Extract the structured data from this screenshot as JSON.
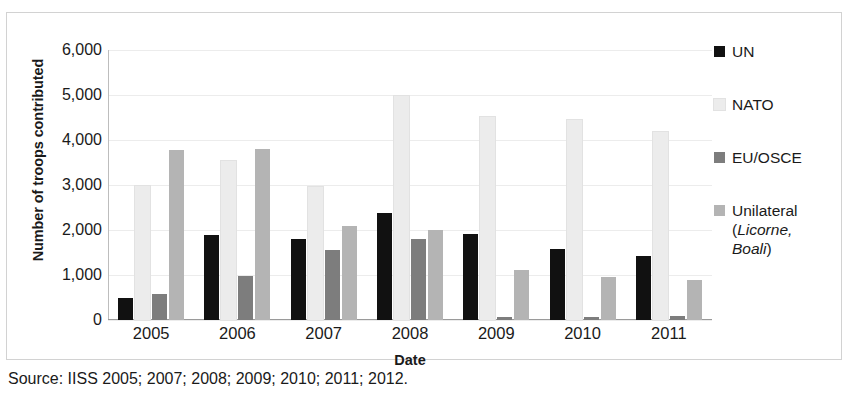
{
  "chart_data": {
    "type": "bar",
    "title": "",
    "xlabel": "Date",
    "ylabel": "Number of troops contributed",
    "categories": [
      "2005",
      "2006",
      "2007",
      "2008",
      "2009",
      "2010",
      "2011"
    ],
    "ylim": [
      0,
      6000
    ],
    "ytick_values": [
      0,
      1000,
      2000,
      3000,
      4000,
      5000,
      6000
    ],
    "ytick_labels": [
      "0",
      "1,000",
      "2,000",
      "3,000",
      "4,000",
      "5,000",
      "6,000"
    ],
    "grid": true,
    "legend_position": "right",
    "series": [
      {
        "name": "UN",
        "color": "#111111",
        "values": [
          490,
          1880,
          1790,
          2370,
          1910,
          1570,
          1430
        ]
      },
      {
        "name": "NATO",
        "color": "#ececec",
        "values": [
          2970,
          3540,
          2960,
          4970,
          4520,
          4440,
          4180
        ]
      },
      {
        "name": "EU/OSCE",
        "color": "#7d7d7d",
        "values": [
          580,
          970,
          1550,
          1810,
          60,
          60,
          80
        ]
      },
      {
        "name": "Unilateral (Licorne, Boali)",
        "color": "#b4b4b4",
        "values": [
          3780,
          3790,
          2080,
          2010,
          1120,
          960,
          890
        ]
      }
    ]
  },
  "legend": {
    "items": [
      {
        "label": "UN",
        "label_italic": "",
        "label_tail": "",
        "color": "#111111"
      },
      {
        "label": "NATO",
        "label_italic": "",
        "label_tail": "",
        "color": "#ececec"
      },
      {
        "label": "EU/OSCE",
        "label_italic": "",
        "label_tail": "",
        "color": "#7d7d7d"
      },
      {
        "label": "Unilateral\n(",
        "label_italic": "Licorne,\nBoali",
        "label_tail": ")",
        "color": "#b4b4b4"
      }
    ]
  },
  "source": {
    "text": "Source: IISS 2005; 2007; 2008; 2009; 2010; 2011; 2012."
  }
}
